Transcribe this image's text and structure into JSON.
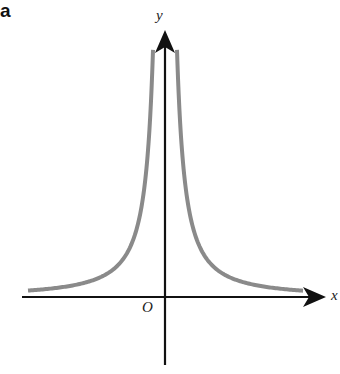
{
  "figure": {
    "panel_label": "a",
    "x_axis_label": "x",
    "y_axis_label": "y",
    "origin_label": "O",
    "colors": {
      "curve": "#8a8a8a",
      "axes": "#111111",
      "background": "#ffffff"
    }
  },
  "chart_data": {
    "type": "line",
    "title": "",
    "xlabel": "x",
    "ylabel": "y",
    "origin": "O",
    "grid": false,
    "legend": null,
    "ticks": [],
    "series": [
      {
        "name": "left branch (x < 0)",
        "behavior": "increases toward +infinity as x approaches 0 from the left; approaches 0 as x approaches -infinity"
      },
      {
        "name": "right branch (x > 0)",
        "behavior": "decreases from +infinity near x = 0 toward 0 as x approaches +infinity"
      }
    ],
    "asymptotes": {
      "vertical": "x = 0",
      "horizontal": "y = 0"
    },
    "symmetry": "even (symmetric about y-axis)"
  }
}
